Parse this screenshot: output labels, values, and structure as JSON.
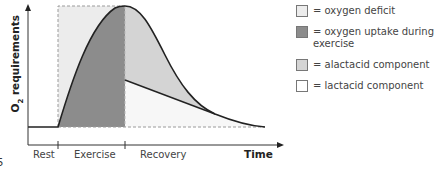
{
  "diagram": {
    "y_axis_label_main": "O",
    "y_axis_label_sub": "2",
    "y_axis_label_rest": " requirements",
    "x_axis_label": "Time",
    "phases": [
      "Rest",
      "Exercise",
      "Recovery"
    ],
    "page_fragment": "5"
  },
  "legend": {
    "items": [
      {
        "label": "= oxygen deficit",
        "color": "#ececec"
      },
      {
        "label": "= oxygen uptake during exercise",
        "color": "#8c8c8c"
      },
      {
        "label": "= alactacid component",
        "color": "#d4d4d4"
      },
      {
        "label": "= lactacid component",
        "color": "#ffffff"
      }
    ]
  },
  "colors": {
    "deficit": "#ececec",
    "uptake": "#8c8c8c",
    "alactacid": "#d4d4d4",
    "lactacid": "#f7f7f7",
    "line": "#222222",
    "dash": "#9a9a9a"
  }
}
